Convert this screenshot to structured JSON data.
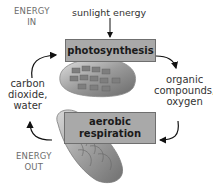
{
  "diagram": {
    "energy_in": {
      "line1": "ENERGY",
      "line2": "IN"
    },
    "energy_out": {
      "line1": "ENERGY",
      "line2": "OUT"
    },
    "input_sunlight": "sunlight energy",
    "process_top": "photosynthesis",
    "process_bottom": {
      "line1": "aerobic",
      "line2": "respiration"
    },
    "left_label": {
      "line1": "carbon",
      "line2": "dioxide,",
      "line3": "water"
    },
    "right_label": {
      "line1": "organic",
      "line2": "compounds,",
      "line3": "oxygen"
    },
    "icons": [
      "chloroplast-illustration",
      "mitochondrion-illustration"
    ],
    "colors": {
      "box_fill": "#a9a9a9",
      "box_border": "#6f6f6f",
      "arrow": "#111111",
      "energy_text": "#6d6d6d"
    }
  }
}
